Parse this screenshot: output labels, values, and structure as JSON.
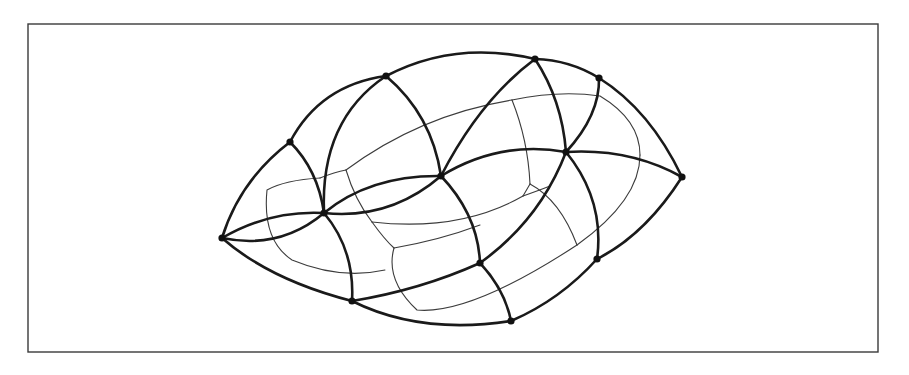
{
  "figure": {
    "width": 909,
    "height": 375,
    "frame": {
      "x": 28,
      "y": 24,
      "width": 850,
      "height": 328
    },
    "colors": {
      "background": "#ffffff",
      "thick_stroke": "#1a1a1a",
      "thin_stroke": "#3c3c3c",
      "frame": "#3a3a3a",
      "node": "#111111"
    },
    "nodes": [
      {
        "id": "A",
        "x": 222,
        "y": 238
      },
      {
        "id": "B",
        "x": 290,
        "y": 142
      },
      {
        "id": "C",
        "x": 386,
        "y": 76
      },
      {
        "id": "D",
        "x": 535,
        "y": 59
      },
      {
        "id": "E",
        "x": 599,
        "y": 78
      },
      {
        "id": "F",
        "x": 682,
        "y": 177
      },
      {
        "id": "G",
        "x": 566,
        "y": 152
      },
      {
        "id": "H",
        "x": 441,
        "y": 176
      },
      {
        "id": "I",
        "x": 324,
        "y": 213
      },
      {
        "id": "J",
        "x": 352,
        "y": 301
      },
      {
        "id": "K",
        "x": 480,
        "y": 263
      },
      {
        "id": "L",
        "x": 511,
        "y": 321
      },
      {
        "id": "M",
        "x": 597,
        "y": 259
      }
    ],
    "thick_curves": [
      {
        "name": "outer-left-upper",
        "d": "M222,238 Q240,180 290,142"
      },
      {
        "name": "arc-B-C",
        "d": "M290,142 Q320,85 386,76"
      },
      {
        "name": "outer-top-C-D",
        "d": "M386,76 Q455,40 535,59"
      },
      {
        "name": "outer-top-D-E",
        "d": "M535,59 Q570,60 599,78"
      },
      {
        "name": "outer-right-E-F",
        "d": "M599,78 Q650,110 682,177"
      },
      {
        "name": "outer-right-F-M",
        "d": "M682,177 Q645,235 597,259"
      },
      {
        "name": "outer-bottom-M-L",
        "d": "M597,259 Q560,300 511,321"
      },
      {
        "name": "outer-bottom-L-J",
        "d": "M511,321 Q420,335 352,301"
      },
      {
        "name": "outer-left-lower",
        "d": "M352,301 Q270,280 222,238"
      },
      {
        "name": "arc-B-I",
        "d": "M290,142 Q318,170 324,213"
      },
      {
        "name": "arc-C-H",
        "d": "M386,76 Q432,115 441,176"
      },
      {
        "name": "arc-I-C-inner",
        "d": "M324,213 Q320,120 386,76"
      },
      {
        "name": "arc-H-D",
        "d": "M441,176 Q480,100 535,59"
      },
      {
        "name": "arc-D-G",
        "d": "M535,59 Q562,100 566,152"
      },
      {
        "name": "arc-G-E",
        "d": "M566,152 Q600,115 599,78"
      },
      {
        "name": "arc-A-I-upper",
        "d": "M222,238 Q270,210 324,213"
      },
      {
        "name": "arc-A-I-lower",
        "d": "M222,238 Q280,250 324,213"
      },
      {
        "name": "arc-I-H-upper",
        "d": "M324,213 Q370,175 441,176"
      },
      {
        "name": "arc-I-H-lower",
        "d": "M324,213 Q390,220 441,176"
      },
      {
        "name": "arc-H-G",
        "d": "M441,176 Q500,140 566,152"
      },
      {
        "name": "arc-G-F",
        "d": "M566,152 Q630,148 682,177"
      },
      {
        "name": "arc-I-J",
        "d": "M324,213 Q355,250 352,301"
      },
      {
        "name": "arc-J-K",
        "d": "M352,301 Q420,290 480,263"
      },
      {
        "name": "arc-H-K",
        "d": "M441,176 Q478,215 480,263"
      },
      {
        "name": "arc-K-L",
        "d": "M480,263 Q505,290 511,321"
      },
      {
        "name": "arc-K-G",
        "d": "M480,263 Q540,220 566,152"
      },
      {
        "name": "arc-G-M",
        "d": "M566,152 Q605,200 597,259"
      }
    ],
    "thin_curves": [
      {
        "name": "thin-left-cell",
        "d": "M320,178 Q285,180 267,190 Q262,240 292,260 Q340,280 385,270"
      },
      {
        "name": "thin-left-top",
        "d": "M320,178 Q335,172 346,170"
      },
      {
        "name": "thin-left-v",
        "d": "M346,170 Q355,200 372,222"
      },
      {
        "name": "thin-upper-band",
        "d": "M346,170 Q420,115 512,100"
      },
      {
        "name": "thin-upper-band-2",
        "d": "M512,100 Q560,90 600,96 Q640,120 640,155"
      },
      {
        "name": "thin-upper-v",
        "d": "M512,100 Q528,140 530,184"
      },
      {
        "name": "thin-mid-band",
        "d": "M372,222 Q460,232 523,196"
      },
      {
        "name": "thin-mid-band-2",
        "d": "M523,196 Q540,190 550,186"
      },
      {
        "name": "thin-mid-v",
        "d": "M523,196 L530,184"
      },
      {
        "name": "thin-mid-right",
        "d": "M530,184 Q560,200 577,245"
      },
      {
        "name": "thin-right-outer",
        "d": "M640,155 Q640,200 577,245"
      },
      {
        "name": "thin-lower-left",
        "d": "M394,248 Q385,280 417,310 Q470,315 577,245"
      },
      {
        "name": "thin-lower-top",
        "d": "M372,222 Q385,240 394,248"
      },
      {
        "name": "thin-lower-link",
        "d": "M394,248 Q440,240 480,225"
      }
    ]
  }
}
